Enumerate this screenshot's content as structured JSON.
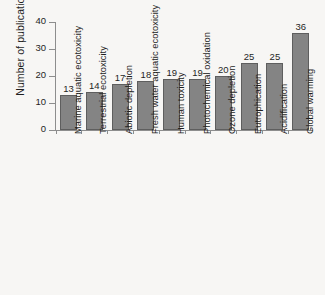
{
  "chart_data": {
    "type": "bar",
    "title": "",
    "xlabel": "",
    "ylabel": "Number of publications",
    "ylim": [
      0,
      40
    ],
    "yticks": [
      0,
      10,
      20,
      30,
      40
    ],
    "grid": false,
    "legend": false,
    "orientation": "vertical",
    "categories": [
      "Marine aquatic ecotoxicity",
      "Terrestrial ecotoxicity",
      "Abiotic depletion",
      "Fresh water aquatic ecotoxicity",
      "Human toxicity",
      "Photochemical oxidation",
      "Ozone depletion",
      "Eutrophication",
      "Acidification",
      "Global warming"
    ],
    "values": [
      13,
      14,
      17,
      18,
      19,
      19,
      20,
      25,
      25,
      36
    ],
    "value_labels": [
      "13",
      "14",
      "17",
      "18",
      "19",
      "19",
      "20",
      "25",
      "25",
      "36"
    ],
    "ytick_labels": [
      "0",
      "10",
      "20",
      "30",
      "40"
    ],
    "bar_color": "#848484",
    "bar_outline_color": "#5e5e5e",
    "axis_color": "#8d8d8d",
    "text_color": "#1f1f1f",
    "background_color": "#f7f6f4"
  }
}
